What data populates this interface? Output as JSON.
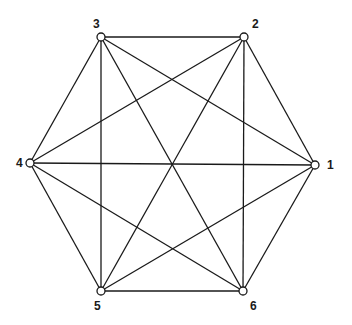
{
  "diagram": {
    "nodes": [
      {
        "id": "1",
        "label": "1",
        "x": 315,
        "y": 165,
        "lx": 327,
        "ly": 169
      },
      {
        "id": "2",
        "label": "2",
        "x": 244,
        "y": 37,
        "lx": 252,
        "ly": 28
      },
      {
        "id": "3",
        "label": "3",
        "x": 101,
        "y": 37,
        "lx": 93,
        "ly": 28
      },
      {
        "id": "4",
        "label": "4",
        "x": 30,
        "y": 163,
        "lx": 16,
        "ly": 167
      },
      {
        "id": "5",
        "label": "5",
        "x": 101,
        "y": 291,
        "lx": 94,
        "ly": 310
      },
      {
        "id": "6",
        "label": "6",
        "x": 243,
        "y": 291,
        "lx": 250,
        "ly": 310
      }
    ],
    "edges": [
      [
        "1",
        "2"
      ],
      [
        "1",
        "3"
      ],
      [
        "1",
        "4"
      ],
      [
        "1",
        "5"
      ],
      [
        "1",
        "6"
      ],
      [
        "2",
        "3"
      ],
      [
        "2",
        "4"
      ],
      [
        "2",
        "5"
      ],
      [
        "2",
        "6"
      ],
      [
        "3",
        "4"
      ],
      [
        "3",
        "5"
      ],
      [
        "3",
        "6"
      ],
      [
        "4",
        "5"
      ],
      [
        "4",
        "6"
      ],
      [
        "5",
        "6"
      ]
    ]
  }
}
